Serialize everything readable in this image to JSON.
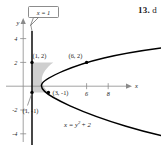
{
  "figure": {
    "problem_number": "13.",
    "problem_text": "d",
    "axes": {
      "x_axis_label": "x",
      "y_axis_label": "y",
      "x_ticks": [
        {
          "value": 6,
          "label": "6"
        },
        {
          "value": 8,
          "label": "8"
        }
      ],
      "y_ticks": [
        {
          "value": 4,
          "label": "4"
        },
        {
          "value": 2,
          "label": "2"
        },
        {
          "value": -2,
          "label": "-2"
        },
        {
          "value": -4,
          "label": "-4"
        }
      ]
    },
    "curves": {
      "parabola_equation": "x = y",
      "parabola_equation_exp": "2",
      "parabola_equation_tail": "+ 2",
      "vertical_line_label": "x = 1"
    },
    "points": [
      {
        "label": "(1, 2)",
        "x": 1,
        "y": 2
      },
      {
        "label": "(6, 2)",
        "x": 6,
        "y": 2
      },
      {
        "label": "(3, -1)",
        "x": 3,
        "y": -1
      },
      {
        "label": "(1, -1)",
        "x": 1,
        "y": -1
      }
    ],
    "colors": {
      "shade": "#cfcfcf",
      "curve": "#000000",
      "axis": "#8a8a8a",
      "text": "#1a1a1a"
    }
  }
}
